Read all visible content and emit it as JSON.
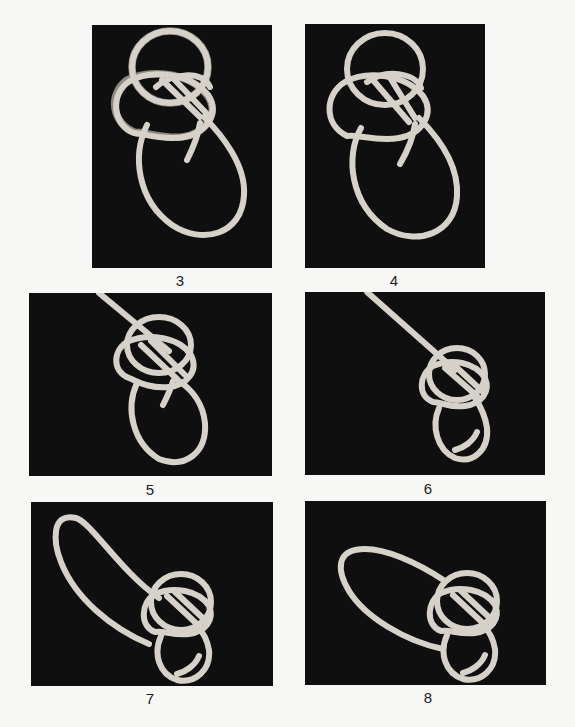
{
  "figure": {
    "panels": [
      {
        "step": "3",
        "caption": "3"
      },
      {
        "step": "4",
        "caption": "4"
      },
      {
        "step": "5",
        "caption": "5"
      },
      {
        "step": "6",
        "caption": "6"
      },
      {
        "step": "7",
        "caption": "7"
      },
      {
        "step": "8",
        "caption": "8"
      }
    ]
  },
  "colors": {
    "page_background": "#f7f7f5",
    "photo_background": "#0f0f0f",
    "rope": "#d6d2ca",
    "caption_text": "#222222"
  }
}
